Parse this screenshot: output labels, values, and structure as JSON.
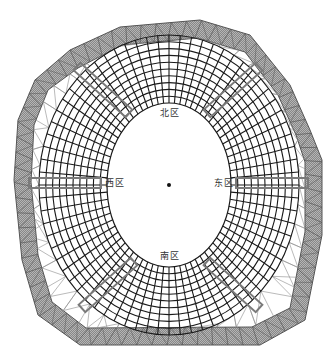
{
  "diagram": {
    "type": "stadium-roof-structural-plan",
    "center": {
      "x": 169,
      "y": 185
    },
    "labels": {
      "north": "北区",
      "west": "西区",
      "east": "东区",
      "south": "南区"
    },
    "label_positions": {
      "north": {
        "x": 160,
        "y": 108
      },
      "west": {
        "x": 105,
        "y": 178
      },
      "east": {
        "x": 214,
        "y": 178
      },
      "south": {
        "x": 160,
        "y": 251
      }
    },
    "colors": {
      "background": "#ffffff",
      "grid_line": "#1a1a1a",
      "truss_band_fill": "#9a9a9a",
      "truss_line": "#555555",
      "triangulation_line": "#8c8c8c",
      "highlight_rect": "#7a7a7a",
      "label_text": "#333333"
    },
    "inner_opening": {
      "rx": 62,
      "ry": 82
    },
    "grid_outer": {
      "rx": 130,
      "ry": 150
    },
    "ring_count": 10,
    "radial_count": 72,
    "outer_band_polygon_outer": [
      [
        70,
        50
      ],
      [
        120,
        27
      ],
      [
        200,
        20
      ],
      [
        250,
        35
      ],
      [
        290,
        85
      ],
      [
        310,
        130
      ],
      [
        322,
        160
      ],
      [
        322,
        235
      ],
      [
        305,
        320
      ],
      [
        260,
        345
      ],
      [
        80,
        345
      ],
      [
        38,
        315
      ],
      [
        22,
        260
      ],
      [
        14,
        180
      ],
      [
        18,
        120
      ],
      [
        35,
        80
      ]
    ],
    "outer_band_polygon_inner": [
      [
        78,
        68
      ],
      [
        122,
        45
      ],
      [
        198,
        38
      ],
      [
        245,
        52
      ],
      [
        278,
        95
      ],
      [
        296,
        135
      ],
      [
        305,
        162
      ],
      [
        305,
        232
      ],
      [
        290,
        308
      ],
      [
        252,
        327
      ],
      [
        86,
        328
      ],
      [
        52,
        302
      ],
      [
        38,
        255
      ],
      [
        31,
        182
      ],
      [
        34,
        125
      ],
      [
        48,
        90
      ]
    ],
    "highlight_rects": [
      {
        "name": "nw-rect",
        "cx": 103,
        "cy": 90,
        "w": 70,
        "h": 10,
        "angle": 42
      },
      {
        "name": "ne-rect",
        "cx": 233,
        "cy": 90,
        "w": 70,
        "h": 10,
        "angle": -42
      },
      {
        "name": "sw-rect",
        "cx": 108,
        "cy": 285,
        "w": 70,
        "h": 10,
        "angle": -42
      },
      {
        "name": "se-rect",
        "cx": 233,
        "cy": 285,
        "w": 70,
        "h": 10,
        "angle": 42
      },
      {
        "name": "w-rect",
        "cx": 65,
        "cy": 183,
        "w": 72,
        "h": 10,
        "angle": 0
      },
      {
        "name": "e-rect",
        "cx": 272,
        "cy": 183,
        "w": 72,
        "h": 10,
        "angle": 0
      }
    ]
  }
}
